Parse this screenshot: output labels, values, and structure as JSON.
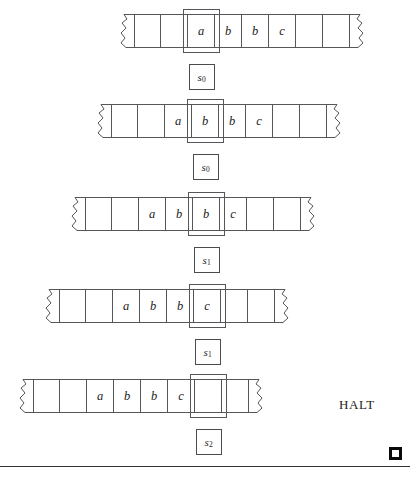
{
  "figure": {
    "kind": "turing-machine-trace",
    "halt_label": "HALT",
    "tombstone": "end-of-proof-square",
    "blank_symbol": "",
    "configurations": [
      {
        "index": 1,
        "state": "s",
        "state_subscript": "0",
        "state_label": "s0",
        "left_px": 118,
        "top_px": 14,
        "head_cell_index": 2,
        "cells": [
          "",
          "",
          "a",
          "b",
          "b",
          "c",
          "",
          ""
        ]
      },
      {
        "index": 2,
        "state": "s",
        "state_subscript": "0",
        "state_label": "s0",
        "left_px": 95,
        "top_px": 104,
        "head_cell_index": 3,
        "cells": [
          "",
          "",
          "a",
          "b",
          "b",
          "c",
          "",
          ""
        ]
      },
      {
        "index": 3,
        "state": "s",
        "state_subscript": "1",
        "state_label": "s1",
        "left_px": 69,
        "top_px": 197,
        "head_cell_index": 4,
        "cells": [
          "",
          "",
          "a",
          "b",
          "b",
          "c",
          "",
          ""
        ]
      },
      {
        "index": 4,
        "state": "s",
        "state_subscript": "1",
        "state_label": "s1",
        "left_px": 43,
        "top_px": 289,
        "head_cell_index": 5,
        "cells": [
          "",
          "",
          "a",
          "b",
          "b",
          "c",
          "",
          ""
        ]
      },
      {
        "index": 5,
        "state": "s",
        "state_subscript": "2",
        "state_label": "s2",
        "left_px": 17,
        "top_px": 379,
        "head_cell_index": 6,
        "cells": [
          "",
          "",
          "a",
          "b",
          "b",
          "c",
          "",
          ""
        ]
      }
    ],
    "halt_left_px": 339,
    "halt_top_px": 397,
    "tombstone_left_px": 389,
    "tombstone_top_px": 447,
    "rule_top_px": 466,
    "colors": {
      "ink": "#1b1b1b",
      "cell_border": "#55565a",
      "rule": "#333333",
      "tombstone": "#0a0a0a",
      "background": "#ffffff"
    }
  }
}
